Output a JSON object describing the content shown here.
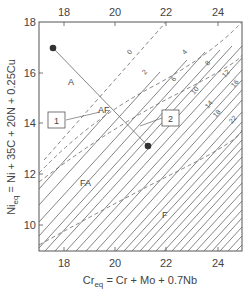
{
  "diagram": {
    "type": "schaeffler-type constitution diagram",
    "x_axis": {
      "label_main": "Cr",
      "label_sub": "eq",
      "label_rest": " = Cr + Mo + 0.7Nb",
      "ticks": [
        "18",
        "20",
        "22",
        "24"
      ],
      "range": [
        17,
        25
      ]
    },
    "y_axis": {
      "label_main": "Ni",
      "label_sub": "eq",
      "label_rest": " = Ni + 35C + 20N + 0.25Cu",
      "ticks": [
        "10",
        "12",
        "14",
        "16",
        "18"
      ],
      "range": [
        9,
        18
      ]
    },
    "top_axis_ticks": [
      "18",
      "20",
      "22",
      "24"
    ],
    "iso_ferrite_labels": [
      "0",
      "2",
      "4",
      "6",
      "8",
      "10",
      "12",
      "14",
      "16",
      "18",
      "22"
    ],
    "region_labels": {
      "austenite": "A",
      "austenite_ferrite": "AF",
      "ferrite_austenite": "FA",
      "ferrite": "F"
    },
    "boxes": [
      "1",
      "2"
    ],
    "points": [
      {
        "name": "point-1",
        "cr": 17.6,
        "ni": 15.8
      },
      {
        "name": "point-2",
        "cr": 21.3,
        "ni": 13.0
      }
    ],
    "colors": {
      "line": "#555555",
      "dashed": "#666666",
      "point": "#333333"
    }
  }
}
